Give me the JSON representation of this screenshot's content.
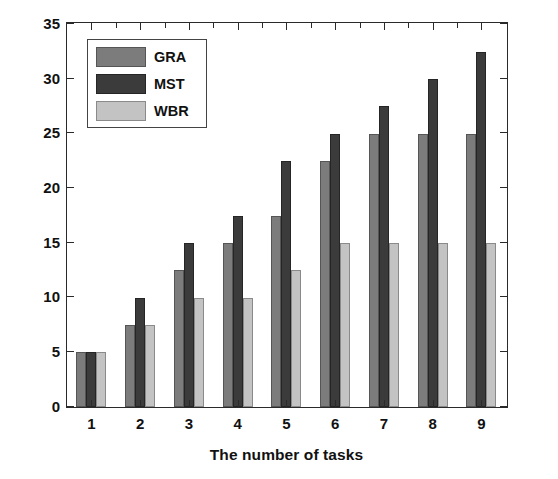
{
  "chart_data": {
    "type": "bar",
    "title": "",
    "subtitle": "",
    "xlabel": "The number of tasks",
    "ylabel": "Average link hops",
    "categories": [
      "1",
      "2",
      "3",
      "4",
      "5",
      "6",
      "7",
      "8",
      "9"
    ],
    "series": [
      {
        "name": "GRA",
        "color": "#7c7c7c",
        "values": [
          5,
          7.5,
          12.5,
          15,
          17.5,
          22.5,
          25,
          25,
          25
        ]
      },
      {
        "name": "MST",
        "color": "#3b3b3b",
        "values": [
          5,
          10,
          15,
          17.5,
          22.5,
          25,
          27.5,
          30,
          32.5
        ]
      },
      {
        "name": "WBR",
        "color": "#c3c3c3",
        "values": [
          5,
          7.5,
          10,
          10,
          12.5,
          15,
          15,
          15,
          15
        ]
      }
    ],
    "ylim": [
      0,
      35
    ],
    "yticks": [
      0,
      5,
      10,
      15,
      20,
      25,
      30,
      35
    ],
    "ytick_labels": [
      "0",
      "5",
      "10",
      "15",
      "20",
      "25",
      "30",
      "35"
    ],
    "grid": false,
    "legend_position": "upper-left",
    "frame": "box",
    "ticks_both_sides": true
  },
  "legend": {
    "entries": [
      {
        "label": "GRA"
      },
      {
        "label": "MST"
      },
      {
        "label": "WBR"
      }
    ]
  }
}
